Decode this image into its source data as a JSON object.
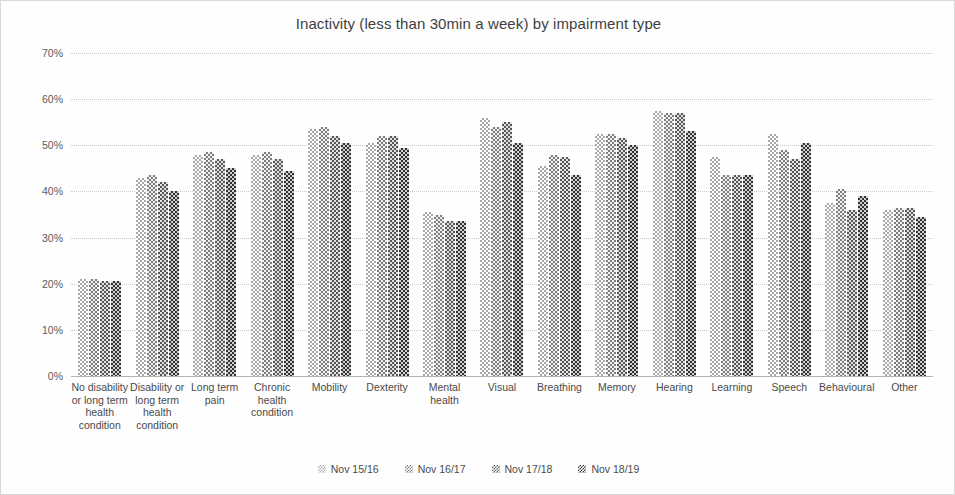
{
  "chart_data": {
    "type": "bar",
    "title": "Inactivity (less than 30min a week) by impairment type",
    "xlabel": "",
    "ylabel": "",
    "ylim": [
      0,
      70
    ],
    "ytick_labels": [
      "70%",
      "60%",
      "50%",
      "40%",
      "30%",
      "20%",
      "10%",
      "0%"
    ],
    "ytick_values": [
      70,
      60,
      50,
      40,
      30,
      20,
      10,
      0
    ],
    "grid": true,
    "legend_position": "bottom",
    "categories": [
      "No disability or long term health condition",
      "Disability or long term health condition",
      "Long term pain",
      "Chronic health condition",
      "Mobility",
      "Dexterity",
      "Mental health",
      "Visual",
      "Breathing",
      "Memory",
      "Hearing",
      "Learning",
      "Speech",
      "Behavioural",
      "Other"
    ],
    "series": [
      {
        "name": "Nov 15/16",
        "values": [
          21.0,
          43.0,
          48.0,
          48.0,
          53.5,
          50.5,
          35.5,
          56.0,
          45.5,
          52.5,
          57.5,
          47.5,
          52.5,
          37.5,
          36.0
        ]
      },
      {
        "name": "Nov 16/17",
        "values": [
          21.0,
          43.5,
          48.5,
          48.5,
          54.0,
          52.0,
          35.0,
          54.0,
          48.0,
          52.5,
          57.0,
          43.5,
          49.0,
          40.5,
          36.5
        ]
      },
      {
        "name": "Nov 17/18",
        "values": [
          20.5,
          42.0,
          47.0,
          47.0,
          52.0,
          52.0,
          33.5,
          55.0,
          47.5,
          51.5,
          57.0,
          43.5,
          47.0,
          36.0,
          36.5
        ]
      },
      {
        "name": "Nov 18/19",
        "values": [
          20.5,
          40.0,
          45.0,
          44.5,
          50.5,
          49.5,
          33.5,
          50.5,
          43.5,
          50.0,
          53.0,
          43.5,
          50.5,
          39.0,
          34.5
        ]
      }
    ],
    "series_colors": [
      "#a8a8a8",
      "#7d7d7d",
      "#565656",
      "#303030"
    ]
  }
}
